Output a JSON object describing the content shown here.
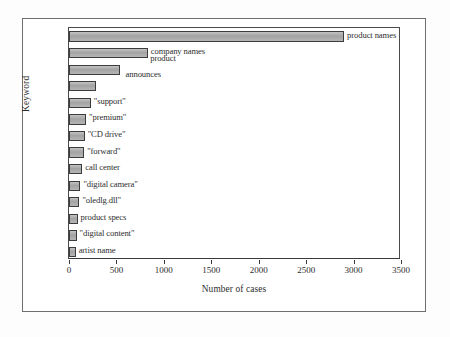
{
  "chart_data": {
    "type": "bar",
    "orientation": "horizontal",
    "title": "",
    "xlabel": "Number of cases",
    "ylabel": "Keyword",
    "xlim": [
      0,
      3500
    ],
    "xticks": [
      0,
      500,
      1000,
      1500,
      2000,
      2500,
      3000,
      3500
    ],
    "grid": false,
    "legend": false,
    "categories": [
      "product names",
      "company names",
      "product",
      "announces",
      "\"support\"",
      "\"premium\"",
      "\"CD drive\"",
      "\"forward\"",
      "call center",
      "\"digital camera\"",
      "\"oledlg.dll\"",
      "product specs",
      "\"digital content\"",
      "artist name"
    ],
    "values": [
      2900,
      830,
      540,
      280,
      230,
      180,
      165,
      160,
      140,
      120,
      110,
      90,
      80,
      70
    ],
    "bar_color": "#a9a9a9",
    "bar_edge_color": "#3c3c3c"
  },
  "bars": [
    {
      "label": "product names",
      "value": 2900,
      "label_position": "right"
    },
    {
      "label": "company names",
      "value": 830,
      "label_position": "right"
    },
    {
      "label": "product",
      "value": 540,
      "label_position": "above"
    },
    {
      "label": "announces",
      "value": 280,
      "label_position": "above"
    },
    {
      "label": "\"support\"",
      "value": 230,
      "label_position": "right"
    },
    {
      "label": "\"premium\"",
      "value": 180,
      "label_position": "right"
    },
    {
      "label": "\"CD drive\"",
      "value": 165,
      "label_position": "right"
    },
    {
      "label": "\"forward\"",
      "value": 160,
      "label_position": "right"
    },
    {
      "label": "call center",
      "value": 140,
      "label_position": "right"
    },
    {
      "label": "\"digital camera\"",
      "value": 120,
      "label_position": "right"
    },
    {
      "label": "\"oledlg.dll\"",
      "value": 110,
      "label_position": "right"
    },
    {
      "label": "product specs",
      "value": 90,
      "label_position": "right"
    },
    {
      "label": "\"digital content\"",
      "value": 80,
      "label_position": "right"
    },
    {
      "label": "artist name",
      "value": 70,
      "label_position": "right"
    }
  ],
  "axes": {
    "x_title": "Number of cases",
    "y_title": "Keyword",
    "x_ticks": [
      "0",
      "500",
      "1000",
      "1500",
      "2000",
      "2500",
      "3000",
      "3500"
    ]
  }
}
